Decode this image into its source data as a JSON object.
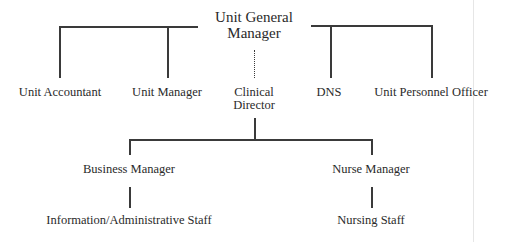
{
  "diagram": {
    "type": "organization-chart",
    "root": {
      "label_line1": "Unit General",
      "label_line2": "Manager"
    },
    "level1": [
      {
        "label": "Unit Accountant",
        "connection": "solid"
      },
      {
        "label": "Unit Manager",
        "connection": "solid"
      },
      {
        "label_line1": "Clinical",
        "label_line2": "Director",
        "connection": "dotted"
      },
      {
        "label": "DNS",
        "connection": "solid"
      },
      {
        "label": "Unit Personnel Officer",
        "connection": "solid"
      }
    ],
    "level2": [
      {
        "label": "Business Manager",
        "parent": "Clinical Director"
      },
      {
        "label": "Nurse Manager",
        "parent": "Clinical Director"
      }
    ],
    "level3": [
      {
        "label": "Information/Administrative Staff",
        "parent": "Business Manager"
      },
      {
        "label": "Nursing Staff",
        "parent": "Nurse Manager"
      }
    ],
    "line_color": "#3a3a3a",
    "text_color": "#2a2a2a"
  }
}
